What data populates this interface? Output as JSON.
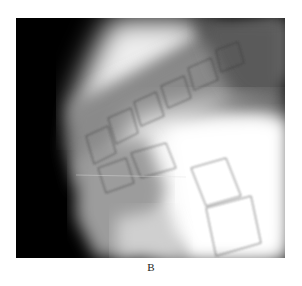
{
  "figure": {
    "label": "B",
    "image_description": "Lateral radiograph of the lumbar spine showing vertebral bodies"
  }
}
